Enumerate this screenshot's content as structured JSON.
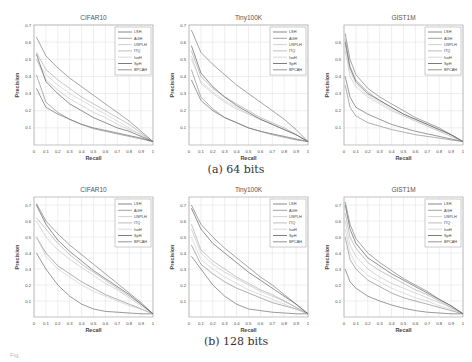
{
  "captions": {
    "a": "(a) 64 bits",
    "b": "(b) 128 bits"
  },
  "figure_fragment": "Fig.",
  "legend": [
    "LSH",
    "AGH",
    "USPLH",
    "ITQ",
    "IsoH",
    "SpH",
    "BPCAH"
  ],
  "series_colors": [
    "#555555",
    "#7a7a7a",
    "#bdbdbd",
    "#a0a0a0",
    "#c8c8c8",
    "#444444",
    "#666666"
  ],
  "chart_data": [
    {
      "type": "line",
      "title": "CIFAR10",
      "group": "(a) 64 bits",
      "xlabel": "Recall",
      "ylabel": "Precision",
      "xlim": [
        0,
        1
      ],
      "ylim": [
        0,
        0.7
      ],
      "xticks": [
        "0",
        "0.1",
        "0.2",
        "0.3",
        "0.4",
        "0.5",
        "0.6",
        "0.7",
        "0.8",
        "0.9",
        "1"
      ],
      "yticks": [
        "0.1",
        "0.2",
        "0.3",
        "0.4",
        "0.5",
        "0.6",
        "0.7"
      ],
      "grid": true,
      "legend_position": "upper right",
      "x": [
        0.02,
        0.1,
        0.2,
        0.3,
        0.4,
        0.5,
        0.6,
        0.7,
        0.8,
        0.9,
        1.0
      ],
      "series": [
        {
          "name": "LSH",
          "values": [
            0.33,
            0.22,
            0.18,
            0.15,
            0.12,
            0.1,
            0.085,
            0.07,
            0.055,
            0.04,
            0.02
          ]
        },
        {
          "name": "AGH",
          "values": [
            0.41,
            0.25,
            0.19,
            0.15,
            0.12,
            0.095,
            0.08,
            0.065,
            0.05,
            0.035,
            0.02
          ]
        },
        {
          "name": "USPLH",
          "values": [
            0.5,
            0.38,
            0.32,
            0.27,
            0.23,
            0.19,
            0.16,
            0.12,
            0.09,
            0.06,
            0.02
          ]
        },
        {
          "name": "ITQ",
          "values": [
            0.54,
            0.44,
            0.38,
            0.33,
            0.28,
            0.24,
            0.2,
            0.16,
            0.12,
            0.07,
            0.02
          ]
        },
        {
          "name": "IsoH",
          "values": [
            0.5,
            0.41,
            0.35,
            0.3,
            0.26,
            0.22,
            0.18,
            0.14,
            0.1,
            0.06,
            0.02
          ]
        },
        {
          "name": "SpH",
          "values": [
            0.53,
            0.37,
            0.3,
            0.24,
            0.2,
            0.16,
            0.13,
            0.1,
            0.08,
            0.05,
            0.02
          ]
        },
        {
          "name": "BPCAH",
          "values": [
            0.63,
            0.52,
            0.45,
            0.39,
            0.34,
            0.29,
            0.24,
            0.19,
            0.14,
            0.08,
            0.02
          ]
        }
      ]
    },
    {
      "type": "line",
      "title": "Tiny100K",
      "group": "(a) 64 bits",
      "xlabel": "Recall",
      "ylabel": "Precision",
      "xlim": [
        0,
        1
      ],
      "ylim": [
        0,
        0.7
      ],
      "xticks": [
        "0",
        "0.1",
        "0.2",
        "0.3",
        "0.4",
        "0.5",
        "0.6",
        "0.7",
        "0.8",
        "0.9",
        "1"
      ],
      "yticks": [
        "0.1",
        "0.2",
        "0.3",
        "0.4",
        "0.5",
        "0.6",
        "0.7"
      ],
      "grid": true,
      "legend_position": "upper right",
      "x": [
        0.02,
        0.1,
        0.2,
        0.3,
        0.4,
        0.5,
        0.6,
        0.7,
        0.8,
        0.9,
        1.0
      ],
      "series": [
        {
          "name": "LSH",
          "values": [
            0.38,
            0.26,
            0.2,
            0.16,
            0.13,
            0.1,
            0.08,
            0.065,
            0.05,
            0.035,
            0.02
          ]
        },
        {
          "name": "AGH",
          "values": [
            0.44,
            0.28,
            0.21,
            0.16,
            0.13,
            0.1,
            0.08,
            0.06,
            0.045,
            0.03,
            0.02
          ]
        },
        {
          "name": "USPLH",
          "values": [
            0.52,
            0.36,
            0.3,
            0.25,
            0.21,
            0.18,
            0.15,
            0.12,
            0.09,
            0.06,
            0.02
          ]
        },
        {
          "name": "ITQ",
          "values": [
            0.55,
            0.4,
            0.33,
            0.28,
            0.24,
            0.2,
            0.16,
            0.13,
            0.1,
            0.06,
            0.02
          ]
        },
        {
          "name": "IsoH",
          "values": [
            0.5,
            0.37,
            0.31,
            0.26,
            0.22,
            0.18,
            0.15,
            0.12,
            0.09,
            0.06,
            0.02
          ]
        },
        {
          "name": "SpH",
          "values": [
            0.58,
            0.42,
            0.34,
            0.28,
            0.23,
            0.19,
            0.15,
            0.12,
            0.09,
            0.06,
            0.02
          ]
        },
        {
          "name": "BPCAH",
          "values": [
            0.67,
            0.54,
            0.47,
            0.41,
            0.35,
            0.3,
            0.25,
            0.2,
            0.15,
            0.09,
            0.02
          ]
        }
      ]
    },
    {
      "type": "line",
      "title": "GIST1M",
      "group": "(a) 64 bits",
      "xlabel": "Recall",
      "ylabel": "Precision",
      "xlim": [
        0,
        1
      ],
      "ylim": [
        0,
        0.7
      ],
      "xticks": [
        "0",
        "0.1",
        "0.2",
        "0.3",
        "0.4",
        "0.5",
        "0.6",
        "0.7",
        "0.8",
        "0.9",
        "1"
      ],
      "yticks": [
        "0.1",
        "0.2",
        "0.3",
        "0.4",
        "0.5",
        "0.6"
      ],
      "grid": true,
      "legend_position": "upper right",
      "x": [
        0.01,
        0.05,
        0.1,
        0.2,
        0.3,
        0.4,
        0.5,
        0.6,
        0.7,
        0.8,
        0.9,
        1.0
      ],
      "series": [
        {
          "name": "LSH",
          "values": [
            0.4,
            0.28,
            0.22,
            0.18,
            0.15,
            0.12,
            0.1,
            0.08,
            0.065,
            0.05,
            0.035,
            0.02
          ]
        },
        {
          "name": "AGH",
          "values": [
            0.35,
            0.22,
            0.17,
            0.13,
            0.11,
            0.09,
            0.075,
            0.06,
            0.05,
            0.04,
            0.03,
            0.02
          ]
        },
        {
          "name": "USPLH",
          "values": [
            0.55,
            0.4,
            0.34,
            0.28,
            0.24,
            0.2,
            0.17,
            0.14,
            0.11,
            0.08,
            0.05,
            0.02
          ]
        },
        {
          "name": "ITQ",
          "values": [
            0.62,
            0.46,
            0.38,
            0.31,
            0.26,
            0.22,
            0.18,
            0.15,
            0.12,
            0.09,
            0.06,
            0.02
          ]
        },
        {
          "name": "IsoH",
          "values": [
            0.58,
            0.43,
            0.36,
            0.29,
            0.25,
            0.21,
            0.17,
            0.14,
            0.11,
            0.08,
            0.05,
            0.02
          ]
        },
        {
          "name": "SpH",
          "values": [
            0.6,
            0.45,
            0.37,
            0.3,
            0.26,
            0.22,
            0.18,
            0.15,
            0.12,
            0.09,
            0.06,
            0.02
          ]
        },
        {
          "name": "BPCAH",
          "values": [
            0.65,
            0.5,
            0.41,
            0.33,
            0.28,
            0.24,
            0.2,
            0.16,
            0.13,
            0.1,
            0.06,
            0.02
          ]
        }
      ]
    },
    {
      "type": "line",
      "title": "CIFAR10",
      "group": "(b) 128 bits",
      "xlabel": "Recall",
      "ylabel": "Precision",
      "xlim": [
        0,
        1
      ],
      "ylim": [
        0,
        0.75
      ],
      "xticks": [
        "0",
        "0.1",
        "0.2",
        "0.3",
        "0.4",
        "0.5",
        "0.6",
        "0.7",
        "0.8",
        "0.9",
        "1"
      ],
      "yticks": [
        "0.1",
        "0.2",
        "0.3",
        "0.4",
        "0.5",
        "0.6",
        "0.7"
      ],
      "grid": true,
      "legend_position": "upper right",
      "x": [
        0.02,
        0.1,
        0.2,
        0.3,
        0.4,
        0.5,
        0.6,
        0.7,
        0.8,
        0.9,
        1.0
      ],
      "series": [
        {
          "name": "LSH",
          "values": [
            0.4,
            0.3,
            0.2,
            0.13,
            0.08,
            0.05,
            0.035,
            0.03,
            0.025,
            0.02,
            0.02
          ]
        },
        {
          "name": "AGH",
          "values": [
            0.5,
            0.4,
            0.32,
            0.27,
            0.22,
            0.18,
            0.14,
            0.11,
            0.08,
            0.05,
            0.02
          ]
        },
        {
          "name": "USPLH",
          "values": [
            0.6,
            0.5,
            0.42,
            0.36,
            0.31,
            0.26,
            0.21,
            0.17,
            0.12,
            0.07,
            0.02
          ]
        },
        {
          "name": "ITQ",
          "values": [
            0.62,
            0.55,
            0.46,
            0.39,
            0.33,
            0.28,
            0.23,
            0.18,
            0.13,
            0.08,
            0.02
          ]
        },
        {
          "name": "IsoH",
          "values": [
            0.5,
            0.38,
            0.3,
            0.25,
            0.2,
            0.16,
            0.13,
            0.1,
            0.07,
            0.05,
            0.02
          ]
        },
        {
          "name": "SpH",
          "values": [
            0.7,
            0.58,
            0.48,
            0.41,
            0.35,
            0.29,
            0.24,
            0.19,
            0.14,
            0.08,
            0.02
          ]
        },
        {
          "name": "BPCAH",
          "values": [
            0.71,
            0.6,
            0.52,
            0.45,
            0.39,
            0.33,
            0.27,
            0.21,
            0.15,
            0.09,
            0.02
          ]
        }
      ]
    },
    {
      "type": "line",
      "title": "Tiny100K",
      "group": "(b) 128 bits",
      "xlabel": "Recall",
      "ylabel": "Precision",
      "xlim": [
        0,
        1
      ],
      "ylim": [
        0,
        0.75
      ],
      "xticks": [
        "0",
        "0.1",
        "0.2",
        "0.3",
        "0.4",
        "0.5",
        "0.6",
        "0.7",
        "0.8",
        "0.9",
        "1"
      ],
      "yticks": [
        "0.1",
        "0.2",
        "0.3",
        "0.4",
        "0.5",
        "0.6",
        "0.7"
      ],
      "grid": true,
      "legend_position": "upper right",
      "x": [
        0.02,
        0.1,
        0.2,
        0.3,
        0.4,
        0.5,
        0.6,
        0.7,
        0.8,
        0.9,
        1.0
      ],
      "series": [
        {
          "name": "LSH",
          "values": [
            0.38,
            0.3,
            0.2,
            0.13,
            0.08,
            0.05,
            0.04,
            0.03,
            0.025,
            0.02,
            0.02
          ]
        },
        {
          "name": "AGH",
          "values": [
            0.45,
            0.33,
            0.27,
            0.22,
            0.18,
            0.15,
            0.12,
            0.09,
            0.07,
            0.05,
            0.02
          ]
        },
        {
          "name": "USPLH",
          "values": [
            0.55,
            0.4,
            0.33,
            0.28,
            0.24,
            0.2,
            0.16,
            0.13,
            0.1,
            0.06,
            0.02
          ]
        },
        {
          "name": "ITQ",
          "values": [
            0.58,
            0.42,
            0.35,
            0.3,
            0.25,
            0.21,
            0.17,
            0.14,
            0.1,
            0.06,
            0.02
          ]
        },
        {
          "name": "IsoH",
          "values": [
            0.5,
            0.36,
            0.3,
            0.25,
            0.21,
            0.17,
            0.14,
            0.11,
            0.08,
            0.05,
            0.02
          ]
        },
        {
          "name": "SpH",
          "values": [
            0.68,
            0.55,
            0.46,
            0.4,
            0.34,
            0.28,
            0.23,
            0.18,
            0.13,
            0.08,
            0.02
          ]
        },
        {
          "name": "BPCAH",
          "values": [
            0.7,
            0.58,
            0.5,
            0.43,
            0.37,
            0.31,
            0.25,
            0.2,
            0.14,
            0.08,
            0.02
          ]
        }
      ]
    },
    {
      "type": "line",
      "title": "GIST1M",
      "group": "(b) 128 bits",
      "xlabel": "Recall",
      "ylabel": "Precision",
      "xlim": [
        0,
        1
      ],
      "ylim": [
        0,
        0.75
      ],
      "xticks": [
        "0",
        "0.1",
        "0.2",
        "0.3",
        "0.4",
        "0.5",
        "0.6",
        "0.7",
        "0.8",
        "0.9",
        "1"
      ],
      "yticks": [
        "0.1",
        "0.2",
        "0.3",
        "0.4",
        "0.5",
        "0.6",
        "0.7"
      ],
      "grid": true,
      "legend_position": "upper right",
      "x": [
        0.01,
        0.05,
        0.1,
        0.2,
        0.3,
        0.4,
        0.5,
        0.6,
        0.7,
        0.8,
        0.9,
        1.0
      ],
      "series": [
        {
          "name": "LSH",
          "values": [
            0.3,
            0.22,
            0.18,
            0.13,
            0.1,
            0.075,
            0.055,
            0.04,
            0.03,
            0.025,
            0.02,
            0.02
          ]
        },
        {
          "name": "AGH",
          "values": [
            0.5,
            0.36,
            0.3,
            0.23,
            0.19,
            0.15,
            0.12,
            0.1,
            0.08,
            0.06,
            0.04,
            0.02
          ]
        },
        {
          "name": "USPLH",
          "values": [
            0.6,
            0.45,
            0.38,
            0.3,
            0.25,
            0.21,
            0.18,
            0.15,
            0.12,
            0.09,
            0.06,
            0.02
          ]
        },
        {
          "name": "ITQ",
          "values": [
            0.65,
            0.5,
            0.43,
            0.34,
            0.29,
            0.25,
            0.21,
            0.17,
            0.14,
            0.1,
            0.06,
            0.02
          ]
        },
        {
          "name": "IsoH",
          "values": [
            0.55,
            0.4,
            0.33,
            0.26,
            0.22,
            0.18,
            0.15,
            0.12,
            0.1,
            0.07,
            0.05,
            0.02
          ]
        },
        {
          "name": "SpH",
          "values": [
            0.7,
            0.55,
            0.46,
            0.37,
            0.32,
            0.27,
            0.23,
            0.19,
            0.15,
            0.11,
            0.07,
            0.02
          ]
        },
        {
          "name": "BPCAH",
          "values": [
            0.72,
            0.58,
            0.49,
            0.4,
            0.34,
            0.29,
            0.24,
            0.2,
            0.16,
            0.11,
            0.07,
            0.02
          ]
        }
      ]
    }
  ]
}
